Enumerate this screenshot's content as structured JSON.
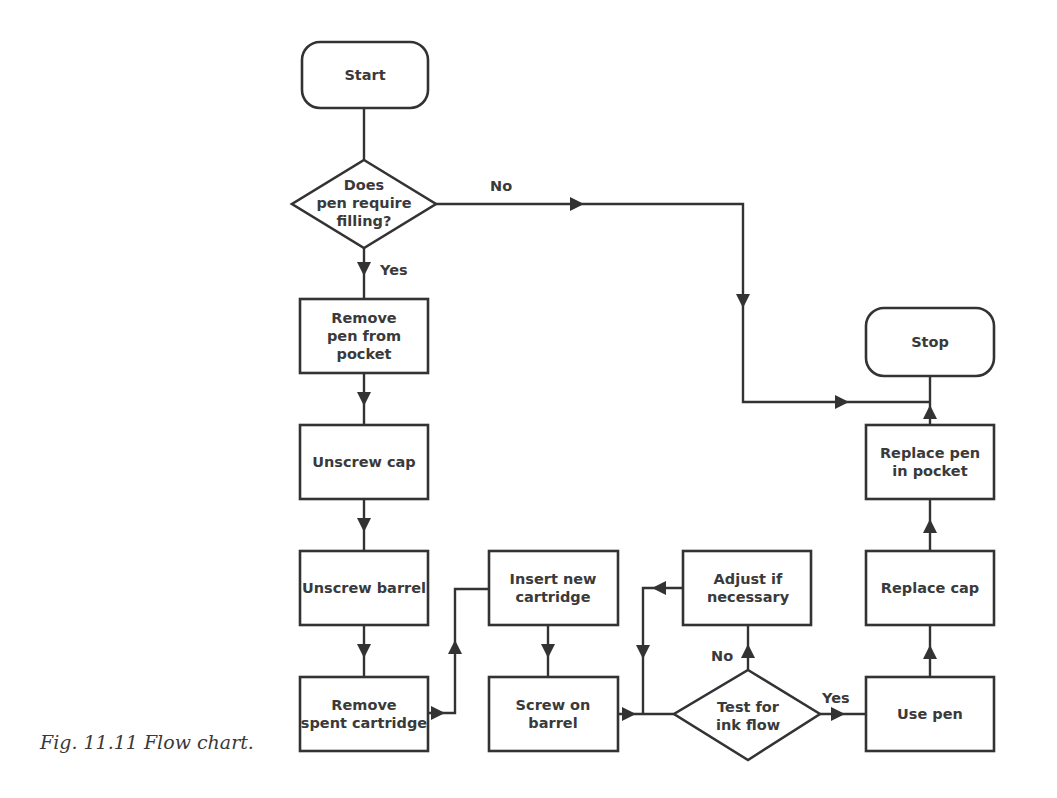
{
  "caption": "Fig. 11.11 Flow chart.",
  "colors": {
    "stroke": "#333333",
    "text": "#3a3a3a",
    "background": "#ffffff"
  },
  "nodes": {
    "start": {
      "type": "terminal",
      "lines": [
        "Start"
      ]
    },
    "decision_fill": {
      "type": "decision",
      "lines": [
        "Does",
        "pen require",
        "filling?"
      ]
    },
    "remove_pen": {
      "type": "process",
      "lines": [
        "Remove",
        "pen from",
        "pocket"
      ]
    },
    "unscrew_cap": {
      "type": "process",
      "lines": [
        "Unscrew cap"
      ]
    },
    "unscrew_barrel": {
      "type": "process",
      "lines": [
        "Unscrew barrel"
      ]
    },
    "remove_spent": {
      "type": "process",
      "lines": [
        "Remove",
        "spent cartridge"
      ]
    },
    "insert_new": {
      "type": "process",
      "lines": [
        "Insert new",
        "cartridge"
      ]
    },
    "screw_on": {
      "type": "process",
      "lines": [
        "Screw on",
        "barrel"
      ]
    },
    "test_flow": {
      "type": "decision",
      "lines": [
        "Test for",
        "ink flow"
      ]
    },
    "adjust": {
      "type": "process",
      "lines": [
        "Adjust if",
        "necessary"
      ]
    },
    "use_pen": {
      "type": "process",
      "lines": [
        "Use pen"
      ]
    },
    "replace_cap": {
      "type": "process",
      "lines": [
        "Replace cap"
      ]
    },
    "replace_pen": {
      "type": "process",
      "lines": [
        "Replace pen",
        "in pocket"
      ]
    },
    "stop": {
      "type": "terminal",
      "lines": [
        "Stop"
      ]
    }
  },
  "edge_labels": {
    "fill_no": "No",
    "fill_yes": "Yes",
    "flow_no": "No",
    "flow_yes": "Yes"
  },
  "edges": [
    {
      "from": "start",
      "to": "decision_fill"
    },
    {
      "from": "decision_fill",
      "to": "remove_pen",
      "label": "Yes"
    },
    {
      "from": "decision_fill",
      "to": "stop",
      "label": "No"
    },
    {
      "from": "remove_pen",
      "to": "unscrew_cap"
    },
    {
      "from": "unscrew_cap",
      "to": "unscrew_barrel"
    },
    {
      "from": "unscrew_barrel",
      "to": "remove_spent"
    },
    {
      "from": "remove_spent",
      "to": "insert_new"
    },
    {
      "from": "insert_new",
      "to": "screw_on"
    },
    {
      "from": "screw_on",
      "to": "test_flow"
    },
    {
      "from": "test_flow",
      "to": "adjust",
      "label": "No"
    },
    {
      "from": "adjust",
      "to": "test_flow"
    },
    {
      "from": "test_flow",
      "to": "use_pen",
      "label": "Yes"
    },
    {
      "from": "use_pen",
      "to": "replace_cap"
    },
    {
      "from": "replace_cap",
      "to": "replace_pen"
    },
    {
      "from": "replace_pen",
      "to": "stop"
    }
  ]
}
